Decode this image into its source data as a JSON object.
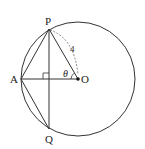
{
  "diagram": {
    "type": "geometry",
    "circle": {
      "center_label": "O",
      "stroke": "#333333"
    },
    "points": [
      {
        "label": "P",
        "x": 49,
        "y": 29
      },
      {
        "label": "A",
        "x": 21,
        "y": 79
      },
      {
        "label": "Q",
        "x": 49,
        "y": 129
      },
      {
        "label": "O",
        "x": 78,
        "y": 79
      }
    ],
    "segments": [
      "PQ",
      "AO",
      "PA",
      "AQ",
      "PO"
    ],
    "arc_label": "4",
    "angle_label": "θ",
    "right_angle_marker": "PQ ⟂ AO"
  }
}
